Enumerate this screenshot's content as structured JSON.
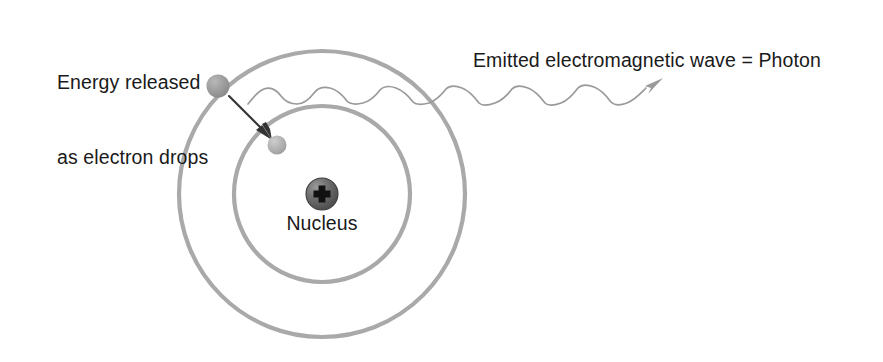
{
  "diagram": {
    "background_color": "#ffffff",
    "labels": {
      "energy_released_line1": "Energy released",
      "energy_released_line2": "as electron drops",
      "photon": "Emitted electromagnetic wave = Photon",
      "nucleus": "Nucleus"
    },
    "colors": {
      "text": "#1a1a1a",
      "orbit_ring": "#a9a9a9",
      "nucleus_fill": "#6b6b6b",
      "nucleus_edge": "#3d3d3d",
      "nucleus_symbol": "#111111",
      "electron_outer": "#9c9c9c",
      "electron_inner": "#b2b2b2",
      "arrow": "#333333",
      "wave": "#9a9a9a"
    },
    "geometry": {
      "center_x": 322,
      "center_y": 194,
      "outer_orbit_radius": 143,
      "inner_orbit_radius": 88,
      "orbit_stroke_width": 4,
      "nucleus_radius": 16,
      "electron_outer": {
        "cx": 218,
        "cy": 86,
        "r": 11.5
      },
      "electron_inner": {
        "cx": 277,
        "cy": 145,
        "r": 9.5
      },
      "arrow_start": {
        "x": 229,
        "y": 96
      },
      "arrow_end": {
        "x": 270,
        "y": 137
      },
      "wave_start_x": 248,
      "wave_end_x": 646,
      "wave_center_y": 96,
      "wave_amplitude": 8,
      "wave_cycles": 6,
      "wave_arrow_tip": {
        "x": 661,
        "y": 80
      }
    },
    "symbols": {
      "nucleus_charge": "+"
    }
  }
}
